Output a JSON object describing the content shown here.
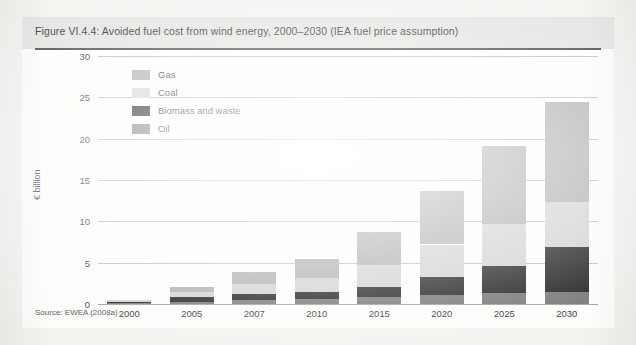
{
  "figure": {
    "title": "Figure VI.4.4: Avoided fuel cost from wind energy, 2000–2030 (IEA fuel price assumption)",
    "source": "Source: EWEA (2008a)"
  },
  "chart_data": {
    "type": "bar",
    "stacked": true,
    "title": "Figure VI.4.4: Avoided fuel cost from wind energy, 2000–2030 (IEA fuel price assumption)",
    "xlabel": "",
    "ylabel": "€ billion",
    "ylim": [
      0,
      30
    ],
    "yticks": [
      0,
      5,
      10,
      15,
      20,
      25,
      30
    ],
    "ytick_labels": [
      "0",
      "5",
      "10",
      "15",
      "20",
      "25",
      "30"
    ],
    "grid": true,
    "legend_position": "upper-left-inside",
    "categories": [
      "2000",
      "2005",
      "2007",
      "2010",
      "2015",
      "2020",
      "2025",
      "2030"
    ],
    "series": [
      {
        "name": "Oil",
        "color": "#6e6e6e",
        "values": [
          0.1,
          0.3,
          0.5,
          0.6,
          0.8,
          1.1,
          1.3,
          1.5
        ]
      },
      {
        "name": "Biomass and waste",
        "color": "#121212",
        "values": [
          0.2,
          0.5,
          0.7,
          0.9,
          1.3,
          2.2,
          3.3,
          5.4
        ]
      },
      {
        "name": "Coal",
        "color": "#cfcfcf",
        "values": [
          0.1,
          0.6,
          1.2,
          1.7,
          2.6,
          3.9,
          5.1,
          5.5
        ]
      },
      {
        "name": "Gas",
        "color": "#a8a8a8",
        "values": [
          0.0,
          0.6,
          1.5,
          2.2,
          4.0,
          6.5,
          9.4,
          12.0
        ]
      }
    ],
    "totals": [
      0.4,
      2.0,
      3.9,
      5.4,
      8.7,
      13.7,
      19.1,
      24.4
    ]
  },
  "legend": {
    "items": [
      {
        "label": "Gas"
      },
      {
        "label": "Coal"
      },
      {
        "label": "Biomass and waste"
      },
      {
        "label": "Oil"
      }
    ]
  }
}
